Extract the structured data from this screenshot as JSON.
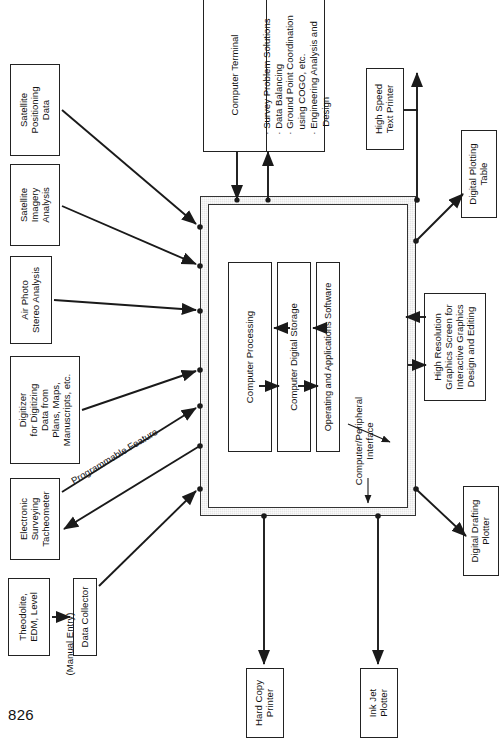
{
  "page": {
    "number": "826"
  },
  "diagram": {
    "main_system": {
      "interface_label_line1": "Computer/Peripheral",
      "interface_label_line2": "Interface",
      "components": [
        {
          "id": "processing",
          "label_line1": "Computer Processing"
        },
        {
          "id": "storage",
          "label_line1": "Computer Digital Storage"
        },
        {
          "id": "software",
          "label_line1": "Operating and Applications Software"
        }
      ]
    },
    "top_boxes": [
      {
        "id": "computer-terminal",
        "title": "Computer Terminal",
        "bullets": [
          "Survey Problem Solutions",
          "Data Balancing",
          "Ground Point Coordination",
          "using COGO, etc.",
          "Engineering Analysis and",
          "Design"
        ],
        "bullet_marks": [
          true,
          true,
          true,
          false,
          true,
          false
        ]
      }
    ],
    "input_boxes": [
      {
        "id": "satellite-positioning-data",
        "lines": [
          "Satellite",
          "Positioning",
          "Data"
        ]
      },
      {
        "id": "satellite-imagery-analysis",
        "lines": [
          "Satellite",
          "Imagery",
          "Analysis"
        ]
      },
      {
        "id": "air-photo-stereo-analysis",
        "lines": [
          "Air Photo",
          "Stereo Analysis"
        ]
      },
      {
        "id": "digitizer",
        "lines": [
          "Digitizer",
          "for Digitizing",
          "Data from",
          "Plans, Maps,",
          "Manuscripts, etc."
        ]
      },
      {
        "id": "electronic-surveying-tacheometer",
        "lines": [
          "Electronic",
          "Surveying",
          "Tacheometer"
        ]
      },
      {
        "id": "theodolite-edm-level",
        "lines": [
          "Theodolite,",
          "EDM, Level"
        ]
      },
      {
        "id": "data-collector",
        "lines": [
          "Data Collector"
        ]
      }
    ],
    "output_boxes": [
      {
        "id": "high-speed-text-printer",
        "lines": [
          "High Speed",
          "Text Printer"
        ]
      },
      {
        "id": "digital-plotting-table",
        "lines": [
          "Digital Plotting",
          "Table"
        ]
      },
      {
        "id": "high-resolution-graphics-screen",
        "lines": [
          "High Resolution",
          "Graphics Screen for",
          "Interactive Graphics",
          "Design and Editing"
        ]
      },
      {
        "id": "digital-drafting-plotter",
        "lines": [
          "Digital Drafting",
          "Plotter"
        ]
      },
      {
        "id": "hard-copy-printer",
        "lines": [
          "Hard Copy",
          "Printer"
        ]
      },
      {
        "id": "ink-jet-plotter",
        "lines": [
          "Ink Jet",
          "Plotter"
        ]
      }
    ],
    "edge_labels": [
      {
        "id": "programmable-feature",
        "text": "Programmable Feature"
      },
      {
        "id": "manual-entry",
        "text": "(Manual Entry)"
      }
    ],
    "colors": {
      "line": "#1a1a1a",
      "box_border": "#333333",
      "interface_fill": "#e6e6e6",
      "page_bg": "#ffffff"
    }
  }
}
